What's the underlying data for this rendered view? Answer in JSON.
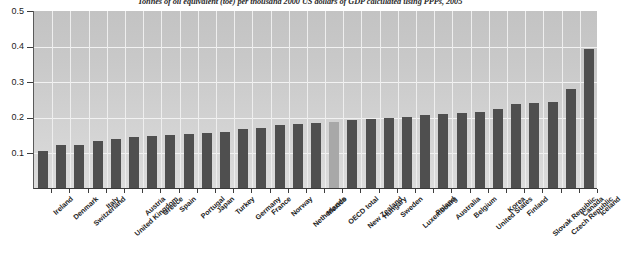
{
  "chart_data": {
    "type": "bar",
    "title": "Tonnes of oil equivalent (toe) per thousand 2000 US dollars of GDP calculated using PPPs, 2005",
    "xlabel": "",
    "ylabel": "",
    "ylim": [
      0,
      0.5
    ],
    "yticks": [
      "0.1",
      "0.2",
      "0.3",
      "0.4",
      "0.5"
    ],
    "ytick_values": [
      0.1,
      0.2,
      0.3,
      0.4,
      0.5
    ],
    "grid": true,
    "legend": "none",
    "highlight_category": "OECD total",
    "highlight_color": "#a8a8a8",
    "bar_color": "#4f4f4f",
    "categories": [
      "Ireland",
      "Denmark",
      "Switzerland",
      "Italy",
      "United Kingdom",
      "Austria",
      "Greece",
      "Spain",
      "Portugal",
      "Japan",
      "Turkey",
      "Germany",
      "France",
      "Norway",
      "Netherlands",
      "Mexico",
      "OECD total",
      "New Zealand",
      "Hungary",
      "Sweden",
      "Luxembourg",
      "Poland",
      "Australia",
      "Belgium",
      "United States",
      "Korea",
      "Finland",
      "Slovak Republic",
      "Czech Republic",
      "Canada",
      "Iceland"
    ],
    "values": [
      0.105,
      0.12,
      0.122,
      0.131,
      0.139,
      0.143,
      0.146,
      0.15,
      0.152,
      0.155,
      0.158,
      0.166,
      0.169,
      0.176,
      0.18,
      0.184,
      0.186,
      0.19,
      0.194,
      0.197,
      0.2,
      0.206,
      0.208,
      0.21,
      0.213,
      0.222,
      0.236,
      0.239,
      0.243,
      0.277,
      0.391
    ]
  },
  "footnote": "",
  "icons": {
    "axis": "axis-icon"
  }
}
